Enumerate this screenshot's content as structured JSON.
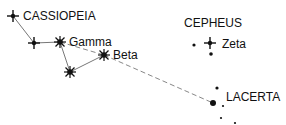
{
  "colors": {
    "ink": "#111111",
    "line": "#777777"
  },
  "constellations": [
    {
      "name": "CASSIOPEIA"
    },
    {
      "name": "CEPHEUS"
    },
    {
      "name": "LACERTA"
    }
  ],
  "stars": {
    "cassiopeia_alpha": {
      "label": "",
      "symbol": "cross-star"
    },
    "cassiopeia_2": {
      "label": "",
      "symbol": "cross-star"
    },
    "gamma": {
      "label": "Gamma",
      "symbol": "burst-star"
    },
    "cassiopeia_lower": {
      "label": "",
      "symbol": "burst-star"
    },
    "beta": {
      "label": "Beta",
      "symbol": "burst-star"
    },
    "zeta": {
      "label": "Zeta",
      "symbol": "cross-star"
    },
    "lacerta_main": {
      "label": "",
      "symbol": "dot-large"
    }
  },
  "legend_note": "Dashed line: pointer from Beta toward Lacerta"
}
